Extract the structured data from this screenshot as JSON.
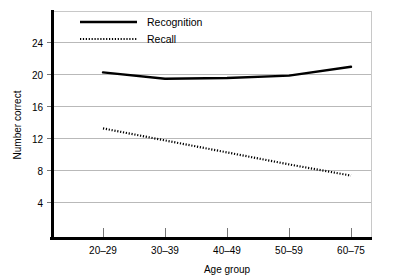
{
  "chart_data": {
    "type": "line",
    "title": "",
    "xlabel": "Age group",
    "ylabel": "Number correct",
    "categories": [
      "20–29",
      "30–39",
      "40–49",
      "50–59",
      "60–75"
    ],
    "ylim": [
      0,
      26
    ],
    "yticks": [
      4,
      8,
      12,
      16,
      20,
      24
    ],
    "ytick_labels": [
      "4",
      "8",
      "12",
      "16",
      "20",
      "24"
    ],
    "grid": true,
    "grid_axis": "y",
    "legend_position": "top-left-inside",
    "series": [
      {
        "name": "Recognition",
        "style": "solid",
        "color": "#000000",
        "values": [
          20.3,
          19.5,
          19.6,
          19.9,
          21.0
        ]
      },
      {
        "name": "Recall",
        "style": "dotted",
        "color": "#000000",
        "values": [
          13.3,
          11.8,
          10.3,
          8.8,
          7.4
        ]
      }
    ]
  },
  "legend": {
    "entries": [
      {
        "label": "Recognition"
      },
      {
        "label": "Recall"
      }
    ]
  },
  "axes": {
    "y_title": "Number correct",
    "x_title": "Age group"
  }
}
